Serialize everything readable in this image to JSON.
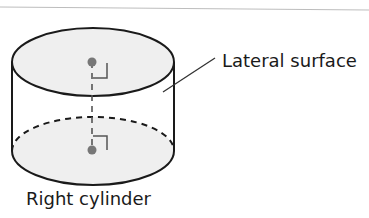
{
  "diagram": {
    "title": "Right cylinder",
    "labels": {
      "lateral_surface": "Lateral surface",
      "caption": "Right cylinder"
    },
    "elements": [
      {
        "id": "top-base",
        "shape": "ellipse",
        "style": "solid",
        "fill": "light-gray"
      },
      {
        "id": "bottom-base",
        "shape": "ellipse",
        "front_half": "solid",
        "back_half": "dashed",
        "fill": "light-gray"
      },
      {
        "id": "lateral-surface",
        "shape": "cylinder-sides",
        "style": "solid"
      },
      {
        "id": "axis",
        "shape": "line",
        "style": "dashed",
        "connects": [
          "top-center",
          "bottom-center"
        ]
      },
      {
        "id": "top-center",
        "shape": "dot"
      },
      {
        "id": "bottom-center",
        "shape": "dot"
      },
      {
        "id": "right-angle-top",
        "shape": "right-angle-marker"
      },
      {
        "id": "right-angle-bottom",
        "shape": "right-angle-marker"
      },
      {
        "id": "leader-line",
        "shape": "line",
        "points_to": "lateral-surface"
      }
    ],
    "colors": {
      "stroke": "#1a1a1a",
      "fill": "#efefef",
      "dot": "#777777",
      "marker": "#555555",
      "rule": "#bdbdbd"
    }
  }
}
